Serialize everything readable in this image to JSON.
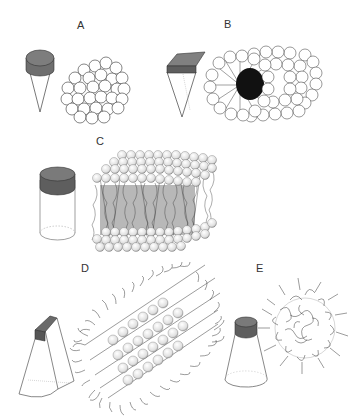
{
  "figure": {
    "panels": [
      {
        "id": "A",
        "label": "A",
        "shape": "cone",
        "aggregate": "spherical micelle"
      },
      {
        "id": "B",
        "label": "B",
        "shape": "truncated wedge",
        "aggregate": "cylindrical micelle"
      },
      {
        "id": "C",
        "label": "C",
        "shape": "cylinder",
        "aggregate": "bilayer"
      },
      {
        "id": "D",
        "label": "D",
        "shape": "truncated wedge",
        "aggregate": "inverted cylindrical / hexagonal"
      },
      {
        "id": "E",
        "label": "E",
        "shape": "truncated cone",
        "aggregate": "inverted micelle"
      }
    ]
  },
  "colors": {
    "head": "#7a7a7a",
    "outline": "#333333",
    "tail": "#222222"
  }
}
